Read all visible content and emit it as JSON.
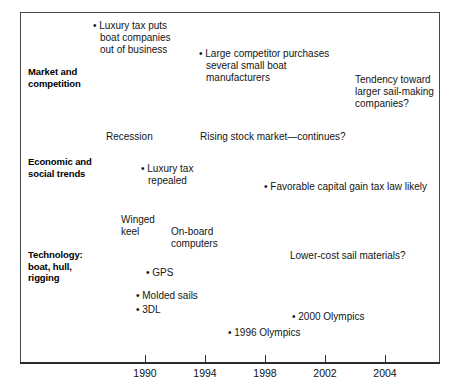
{
  "diagram": {
    "type": "timeline",
    "bands": [
      {
        "id": "market-and-competition",
        "label": "Market and\ncompetition",
        "y": 66
      },
      {
        "id": "economic-and-social-trends",
        "label": "Economic and\nsocial trends",
        "y": 156
      },
      {
        "id": "technology-boat-hull-rigging",
        "label": "Technology:\nboat, hull,\nrigging",
        "y": 249
      }
    ],
    "notes": [
      {
        "id": "luxury-tax-puts-boat-companies-out-of-business",
        "band": "market-and-competition",
        "text": "Luxury tax puts\nboat companies\nout of business",
        "bullet": true,
        "x": 93,
        "y": 20,
        "width": 120
      },
      {
        "id": "large-competitor-purchases-several-small-boat-manufacturers",
        "band": "market-and-competition",
        "text": "Large competitor purchases\nseveral small boat\nmanufacturers",
        "bullet": true,
        "x": 199,
        "y": 48,
        "width": 165
      },
      {
        "id": "tendency-toward-larger-sail-making-companies",
        "band": "market-and-competition",
        "text": "Tendency toward\nlarger sail-making\ncompanies?",
        "bullet": false,
        "x": 355,
        "y": 74,
        "width": 100
      },
      {
        "id": "recession",
        "band": "economic-and-social-trends",
        "text": "Recession",
        "bullet": false,
        "x": 106,
        "y": 131,
        "width": 80
      },
      {
        "id": "rising-stock-market-continues",
        "band": "economic-and-social-trends",
        "text": "Rising stock market—continues?",
        "bullet": false,
        "x": 200,
        "y": 131,
        "width": 190
      },
      {
        "id": "luxury-tax-repealed",
        "band": "economic-and-social-trends",
        "text": "Luxury tax\nrepealed",
        "bullet": true,
        "x": 141,
        "y": 163,
        "width": 80
      },
      {
        "id": "favorable-capital-gain-tax-law-likely",
        "band": "economic-and-social-trends",
        "text": "Favorable capital gain tax law likely",
        "bullet": true,
        "x": 264,
        "y": 181,
        "width": 185
      },
      {
        "id": "winged-keel",
        "band": "technology-boat-hull-rigging",
        "text": "Winged\nkeel",
        "bullet": false,
        "x": 121,
        "y": 214,
        "width": 55
      },
      {
        "id": "on-board-computers",
        "band": "technology-boat-hull-rigging",
        "text": "On-board\ncomputers",
        "bullet": false,
        "x": 171,
        "y": 226,
        "width": 70
      },
      {
        "id": "lower-cost-sail-materials",
        "band": "technology-boat-hull-rigging",
        "text": "Lower-cost sail materials?",
        "bullet": false,
        "x": 290,
        "y": 250,
        "width": 145
      },
      {
        "id": "gps",
        "band": "technology-boat-hull-rigging",
        "text": "GPS",
        "bullet": true,
        "x": 146,
        "y": 267,
        "width": 60
      },
      {
        "id": "molded-sails",
        "band": "technology-boat-hull-rigging",
        "text": "Molded sails",
        "bullet": true,
        "x": 136,
        "y": 290,
        "width": 90
      },
      {
        "id": "3dl",
        "band": "technology-boat-hull-rigging",
        "text": "3DL",
        "bullet": true,
        "x": 136,
        "y": 304,
        "width": 60
      },
      {
        "id": "2000-olympics",
        "band": "technology-boat-hull-rigging",
        "text": "2000 Olympics",
        "bullet": true,
        "x": 292,
        "y": 311,
        "width": 100
      },
      {
        "id": "1996-olympics",
        "band": "technology-boat-hull-rigging",
        "text": "1996 Olympics",
        "bullet": true,
        "x": 228,
        "y": 327,
        "width": 100
      }
    ],
    "axis": {
      "ticks": [
        {
          "label": "1990",
          "x": 145
        },
        {
          "label": "1994",
          "x": 205
        },
        {
          "label": "1998",
          "x": 265
        },
        {
          "label": "2002",
          "x": 325
        },
        {
          "label": "2004",
          "x": 385
        }
      ]
    },
    "colors": {
      "frame": "#4a4a4a",
      "axis": "#2b2b2b",
      "text": "#141414",
      "background": "#ffffff"
    }
  }
}
